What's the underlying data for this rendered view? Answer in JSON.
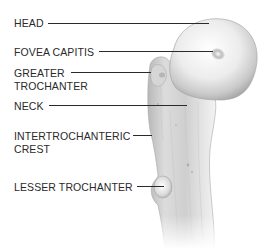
{
  "diagram": {
    "labels": [
      {
        "id": "head",
        "text": "HEAD"
      },
      {
        "id": "fovea-capitis",
        "text": "FOVEA CAPITIS"
      },
      {
        "id": "greater-trochanter",
        "line1": "GREATER",
        "line2": "TROCHANTER"
      },
      {
        "id": "neck",
        "text": "NECK"
      },
      {
        "id": "intertrochanteric-crest",
        "line1": "INTERTROCHANTERIC",
        "line2": "CREST"
      },
      {
        "id": "lesser-trochanter",
        "text": "LESSER TROCHANTER"
      }
    ],
    "colors": {
      "label_text": "#2a2a2a",
      "leader_line": "#2a2a2a",
      "bone_light": "#f4f4f4",
      "bone_mid": "#cfcfcf",
      "bone_dark": "#8a8a8a",
      "background": "#ffffff"
    }
  }
}
